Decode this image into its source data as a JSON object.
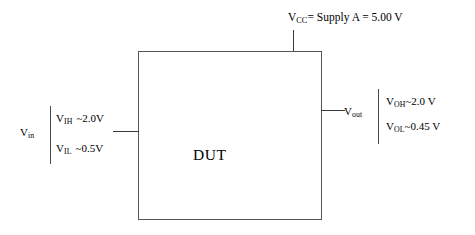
{
  "diagram": {
    "title_block": "DUT",
    "supply": {
      "symbol": "V",
      "symbol_sub": "CC",
      "expression": "=  Supply  A = 5.00 V",
      "full_text": "VCC = Supply A = 5.00 V"
    },
    "input": {
      "port_symbol": "V",
      "port_sub": "in",
      "levels": [
        {
          "symbol": "V",
          "sub": "IH",
          "value": "~2.0V"
        },
        {
          "symbol": "V",
          "sub": "IL",
          "value": "~0.5V"
        }
      ]
    },
    "output": {
      "port_symbol": "V",
      "port_sub": "out",
      "levels": [
        {
          "symbol": "V",
          "sub": "OH",
          "value": "~2.0 V"
        },
        {
          "symbol": "V",
          "sub": "OL",
          "value": "~0.45 V"
        }
      ]
    },
    "colors": {
      "line": "#3a3a3a",
      "box_border": "#555555",
      "text": "#000000",
      "background": "#ffffff"
    }
  }
}
